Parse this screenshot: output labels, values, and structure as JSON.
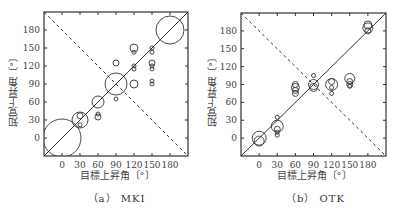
{
  "chart_data": [
    {
      "type": "scatter",
      "title": "(a) MKI",
      "caption": "（a） MKI",
      "xlabel": "目標上昇角〔°〕",
      "ylabel": "知覚上昇角〔°〕",
      "xlim": [
        -30,
        210
      ],
      "ylim": [
        -30,
        210
      ],
      "xticks": [
        0,
        30,
        60,
        90,
        120,
        150,
        180
      ],
      "yticks": [
        0,
        30,
        60,
        90,
        120,
        150,
        180
      ],
      "reference_lines": [
        "solid diagonal y=x",
        "dashed anti-diagonal y=180-x"
      ],
      "marker": "open circle, size proportional to response count",
      "points": [
        {
          "x": 0,
          "y": 0,
          "r": 19
        },
        {
          "x": 30,
          "y": 30,
          "r": 8
        },
        {
          "x": 30,
          "y": 37,
          "r": 3
        },
        {
          "x": 30,
          "y": 22,
          "r": 2
        },
        {
          "x": 60,
          "y": 60,
          "r": 6
        },
        {
          "x": 60,
          "y": 40,
          "r": 2
        },
        {
          "x": 60,
          "y": 35,
          "r": 3
        },
        {
          "x": 90,
          "y": 90,
          "r": 11
        },
        {
          "x": 90,
          "y": 125,
          "r": 3
        },
        {
          "x": 90,
          "y": 65,
          "r": 2
        },
        {
          "x": 120,
          "y": 150,
          "r": 4
        },
        {
          "x": 120,
          "y": 143,
          "r": 2
        },
        {
          "x": 120,
          "y": 120,
          "r": 2
        },
        {
          "x": 120,
          "y": 115,
          "r": 2
        },
        {
          "x": 120,
          "y": 90,
          "r": 4
        },
        {
          "x": 150,
          "y": 150,
          "r": 2
        },
        {
          "x": 150,
          "y": 143,
          "r": 2
        },
        {
          "x": 150,
          "y": 125,
          "r": 3
        },
        {
          "x": 150,
          "y": 120,
          "r": 2
        },
        {
          "x": 150,
          "y": 115,
          "r": 2
        },
        {
          "x": 150,
          "y": 95,
          "r": 2
        },
        {
          "x": 150,
          "y": 90,
          "r": 2
        },
        {
          "x": 180,
          "y": 180,
          "r": 14
        }
      ]
    },
    {
      "type": "scatter",
      "title": "(b) OTK",
      "caption": "（b） OTK",
      "xlabel": "目標上昇角〔°〕",
      "ylabel": "知覚上昇角〔°〕",
      "xlim": [
        -30,
        210
      ],
      "ylim": [
        -30,
        210
      ],
      "xticks": [
        0,
        30,
        60,
        90,
        120,
        150,
        180
      ],
      "yticks": [
        0,
        30,
        60,
        90,
        120,
        150,
        180
      ],
      "reference_lines": [
        "solid diagonal y=x",
        "dashed anti-diagonal y=180-x"
      ],
      "marker": "open circle, size proportional to response count",
      "points": [
        {
          "x": 0,
          "y": 0,
          "r": 7
        },
        {
          "x": 0,
          "y": -5,
          "r": 5
        },
        {
          "x": 30,
          "y": 35,
          "r": 2
        },
        {
          "x": 30,
          "y": 20,
          "r": 6
        },
        {
          "x": 30,
          "y": 15,
          "r": 3
        },
        {
          "x": 30,
          "y": 10,
          "r": 2
        },
        {
          "x": 30,
          "y": 5,
          "r": 2
        },
        {
          "x": 60,
          "y": 90,
          "r": 3
        },
        {
          "x": 60,
          "y": 85,
          "r": 4
        },
        {
          "x": 60,
          "y": 80,
          "r": 3
        },
        {
          "x": 60,
          "y": 75,
          "r": 3
        },
        {
          "x": 90,
          "y": 105,
          "r": 2
        },
        {
          "x": 90,
          "y": 90,
          "r": 5
        },
        {
          "x": 90,
          "y": 85,
          "r": 4
        },
        {
          "x": 120,
          "y": 90,
          "r": 6
        },
        {
          "x": 120,
          "y": 95,
          "r": 3
        },
        {
          "x": 120,
          "y": 85,
          "r": 2
        },
        {
          "x": 120,
          "y": 75,
          "r": 2
        },
        {
          "x": 150,
          "y": 100,
          "r": 5
        },
        {
          "x": 150,
          "y": 95,
          "r": 3
        },
        {
          "x": 150,
          "y": 90,
          "r": 3
        },
        {
          "x": 150,
          "y": 87,
          "r": 2
        },
        {
          "x": 180,
          "y": 190,
          "r": 4
        },
        {
          "x": 180,
          "y": 185,
          "r": 5
        },
        {
          "x": 180,
          "y": 180,
          "r": 3
        }
      ]
    }
  ],
  "panels": [
    {
      "caption": "（a） MKI",
      "xlabel": "目標上昇角〔°〕",
      "ylabel": "知覚上昇角〔°〕"
    },
    {
      "caption": "（b） OTK",
      "xlabel": "目標上昇角〔°〕",
      "ylabel": "知覚上昇角〔°〕"
    }
  ],
  "colors": {
    "stroke": "#333333",
    "background": "#ffffff"
  }
}
